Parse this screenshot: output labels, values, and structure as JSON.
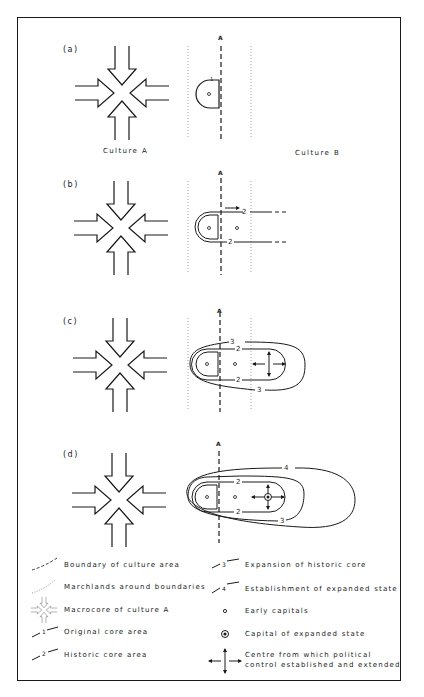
{
  "panels": [
    {
      "label": "(a)",
      "boundary_label": "A"
    },
    {
      "label": "(b)",
      "boundary_label": "A"
    },
    {
      "label": "(c)",
      "boundary_label": "A"
    },
    {
      "label": "(d)",
      "boundary_label": "A"
    }
  ],
  "cultures": {
    "left": "Culture A",
    "right": "Culture B"
  },
  "line_numbers": {
    "one": "1",
    "two": "2",
    "three": "3",
    "four": "4"
  },
  "legend": {
    "left": [
      {
        "icon": "dashed-boundary-line-icon",
        "label": "Boundary of culture area"
      },
      {
        "icon": "dotted-marchland-line-icon",
        "label": "Marchlands around boundaries"
      },
      {
        "icon": "converging-arrows-icon",
        "label": "Macrocore of culture A"
      },
      {
        "icon": "line-1-icon",
        "num": "1",
        "label": "Original core area"
      },
      {
        "icon": "line-2-icon",
        "num": "2",
        "label": "Historic core area"
      }
    ],
    "right": [
      {
        "icon": "line-3-icon",
        "num": "3",
        "label": "Expansion of historic core"
      },
      {
        "icon": "line-4-icon",
        "num": "4",
        "label": "Establishment of expanded state"
      },
      {
        "icon": "small-circle-icon",
        "label": "Early capitals"
      },
      {
        "icon": "double-circle-icon",
        "label": "Capital of expanded state"
      },
      {
        "icon": "four-way-arrows-icon",
        "label_line1": "Centre from which political",
        "label_line2": "control established and extended"
      }
    ]
  },
  "colors": {
    "ink": "#1a1a1a",
    "paper": "#ffffff",
    "dotted": "#888888"
  }
}
